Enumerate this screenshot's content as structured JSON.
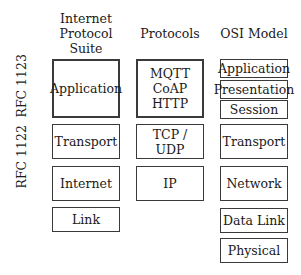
{
  "headers": {
    "ips": "Internet\nProtocol\nSuite",
    "protocols": "Protocols",
    "osi": "OSI Model"
  },
  "rfc_labels": {
    "upper": "RFC 1123",
    "lower": "RFC 1122"
  },
  "ips_layers": [
    "Application",
    "Transport",
    "Internet",
    "Link"
  ],
  "protocol_layers": [
    "MQTT\nCoAP\nHTTP",
    "TCP / UDP",
    "IP"
  ],
  "osi_layers": [
    "Application",
    "Presentation",
    "Session",
    "Transport",
    "Network",
    "Data Link",
    "Physical"
  ]
}
